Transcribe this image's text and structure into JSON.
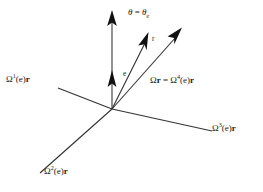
{
  "figure": {
    "background_color": "#ffffff",
    "line_color": "#333333",
    "text_color": "#1a1a1a",
    "width": 263,
    "height": 192,
    "origin": {
      "x": 112,
      "y": 109
    }
  },
  "labels": {
    "theta": {
      "text": "θ = θe",
      "greek": "θ",
      "equals": " = ",
      "base": "θ",
      "subscript": "e"
    },
    "e": {
      "text": "e"
    },
    "r": {
      "text": "r"
    },
    "omega1": {
      "prefix": "Ω",
      "superscript": "1",
      "middle": "(e)",
      "vector": "r",
      "text": "Ω1(e)r"
    },
    "omega2": {
      "prefix": "Ω",
      "superscript": "2",
      "middle": "(e)",
      "vector": "r",
      "text": "Ω2(e)r"
    },
    "omega3": {
      "prefix": "Ω",
      "superscript": "3",
      "middle": "(e)",
      "vector": "r",
      "text": "Ω3(e)r"
    },
    "omega_r": {
      "lhs_prefix": "Ω",
      "lhs_vector": "r",
      "equals": " = ",
      "rhs_prefix": "Ω",
      "superscript": "4",
      "middle": "(e)",
      "vector": "r",
      "text": "Ωr = Ω4(e)r"
    }
  },
  "geometry": {
    "vertical_axis": {
      "x1": 112,
      "y1": 109,
      "x2": 112,
      "y2": 18,
      "arrow_tip": {
        "x": 112,
        "y": 12
      },
      "inner_arrow_tip": {
        "x": 112,
        "y": 72
      }
    },
    "axis_omega1": {
      "x1": 58,
      "y1": 88,
      "x2": 112,
      "y2": 109
    },
    "axis_omega3": {
      "x1": 112,
      "y1": 109,
      "x2": 212,
      "y2": 131
    },
    "axis_omega2": {
      "x1": 112,
      "y1": 109,
      "x2": 40,
      "y2": 173
    },
    "vector_r": {
      "x1": 112,
      "y1": 109,
      "x2": 148,
      "y2": 36
    },
    "vector_omega_r": {
      "x1": 112,
      "y1": 109,
      "x2": 180,
      "y2": 30
    }
  }
}
